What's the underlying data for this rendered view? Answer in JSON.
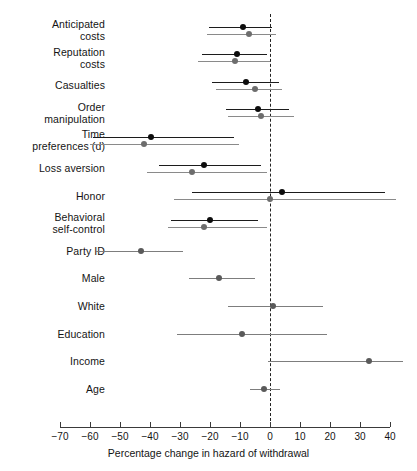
{
  "chart_data": {
    "type": "scatter",
    "subtype": "forest-plot",
    "title": "",
    "xlabel": "Percentage change in hazard of withdrawal",
    "ylabel": "",
    "xlim": [
      -70,
      40
    ],
    "xticks": [
      -70,
      -60,
      -50,
      -40,
      -30,
      -20,
      -10,
      0,
      10,
      20,
      30,
      40
    ],
    "xtick_labels": [
      "−70",
      "−60",
      "−50",
      "−40",
      "−30",
      "−20",
      "−10",
      "0",
      "10",
      "20",
      "30",
      "40"
    ],
    "grid": false,
    "legend": null,
    "reference_line": {
      "x": 0,
      "style": "dashed",
      "color": "#222222"
    },
    "categories": [
      "Anticipated\ncosts",
      "Reputation\ncosts",
      "Casualties",
      "Order\nmanipulation",
      "Time\npreferences (d)",
      "Loss aversion",
      "Honor",
      "Behavioral\nself-control",
      "Party ID",
      "Male",
      "White",
      "Education",
      "Income",
      "Age"
    ],
    "series": [
      {
        "name": "model-1",
        "color": "#0d0d0d",
        "points": [
          {
            "category": "Anticipated costs",
            "estimate": -9.0,
            "ci_low": -20.3,
            "ci_high": 0.7
          },
          {
            "category": "Reputation costs",
            "estimate": -11.0,
            "ci_low": -22.7,
            "ci_high": -1.0
          },
          {
            "category": "Casualties",
            "estimate": -8.0,
            "ci_low": -19.3,
            "ci_high": 3.0
          },
          {
            "category": "Order manipulation",
            "estimate": -4.0,
            "ci_low": -14.7,
            "ci_high": 6.3
          },
          {
            "category": "Time preferences (d)",
            "estimate": -39.7,
            "ci_low": -59.0,
            "ci_high": -12.0
          },
          {
            "category": "Loss aversion",
            "estimate": -22.0,
            "ci_low": -37.0,
            "ci_high": -3.0
          },
          {
            "category": "Honor",
            "estimate": 4.0,
            "ci_low": -26.0,
            "ci_high": 38.3
          },
          {
            "category": "Behavioral self-control",
            "estimate": -20.0,
            "ci_low": -33.0,
            "ci_high": -4.0
          }
        ]
      },
      {
        "name": "model-2",
        "color": "#6d6d6d",
        "points": [
          {
            "category": "Anticipated costs",
            "estimate": -7.0,
            "ci_low": -21.0,
            "ci_high": 2.0
          },
          {
            "category": "Reputation costs",
            "estimate": -11.7,
            "ci_low": -24.0,
            "ci_high": 0.0
          },
          {
            "category": "Casualties",
            "estimate": -5.0,
            "ci_low": -18.0,
            "ci_high": 4.0
          },
          {
            "category": "Order manipulation",
            "estimate": -3.0,
            "ci_low": -14.0,
            "ci_high": 8.0
          },
          {
            "category": "Time preferences (d)",
            "estimate": -42.0,
            "ci_low": -60.0,
            "ci_high": -10.3
          },
          {
            "category": "Loss aversion",
            "estimate": -26.0,
            "ci_low": -41.0,
            "ci_high": -1.0
          },
          {
            "category": "Honor",
            "estimate": 0.0,
            "ci_low": -32.0,
            "ci_high": 42.0
          },
          {
            "category": "Behavioral self-control",
            "estimate": -22.0,
            "ci_low": -34.0,
            "ci_high": -1.0
          }
        ]
      },
      {
        "name": "covariates",
        "color": "#5a5a5a",
        "points": [
          {
            "category": "Party ID",
            "estimate": -43.0,
            "ci_low": -58.0,
            "ci_high": -29.0
          },
          {
            "category": "Male",
            "estimate": -17.0,
            "ci_low": -27.0,
            "ci_high": -5.0
          },
          {
            "category": "White",
            "estimate": 1.0,
            "ci_low": -14.0,
            "ci_high": 17.7
          },
          {
            "category": "Education",
            "estimate": -9.3,
            "ci_low": -31.0,
            "ci_high": 19.0
          },
          {
            "category": "Income",
            "estimate": 33.0,
            "ci_low": -0.7,
            "ci_high": 44.3
          },
          {
            "category": "Age",
            "estimate": -2.0,
            "ci_low": -6.7,
            "ci_high": 3.3
          }
        ]
      }
    ]
  },
  "labels": [
    {
      "id": "anticipated-costs",
      "text": "Anticipated\ncosts"
    },
    {
      "id": "reputation-costs",
      "text": "Reputation\ncosts"
    },
    {
      "id": "casualties",
      "text": "Casualties"
    },
    {
      "id": "order-manipulation",
      "text": "Order\nmanipulation"
    },
    {
      "id": "time-preferences",
      "text": "Time\npreferences (d)"
    },
    {
      "id": "loss-aversion",
      "text": "Loss aversion"
    },
    {
      "id": "honor",
      "text": "Honor"
    },
    {
      "id": "behavioral-self-control",
      "text": "Behavioral\nself-control"
    },
    {
      "id": "party-id",
      "text": "Party ID"
    },
    {
      "id": "male",
      "text": "Male"
    },
    {
      "id": "white",
      "text": "White"
    },
    {
      "id": "education",
      "text": "Education"
    },
    {
      "id": "income",
      "text": "Income"
    },
    {
      "id": "age",
      "text": "Age"
    }
  ],
  "axis": {
    "title": "Percentage change in hazard of withdrawal",
    "tick_labels": [
      "−70",
      "−60",
      "−50",
      "−40",
      "−30",
      "−20",
      "−10",
      "0",
      "10",
      "20",
      "30",
      "40"
    ]
  }
}
